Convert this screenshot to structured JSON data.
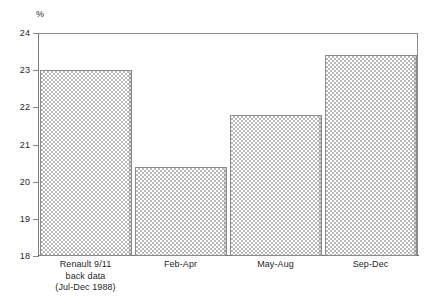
{
  "chart_data": {
    "type": "bar",
    "title": "",
    "subtitle": "",
    "xlabel": "",
    "ylabel": "%",
    "ylim": [
      18,
      24
    ],
    "ytick_labels": [
      "24",
      "23",
      "22",
      "21",
      "20",
      "19",
      "18"
    ],
    "yticks": [
      24,
      23,
      22,
      21,
      20,
      19,
      18
    ],
    "grid": false,
    "legend": "none",
    "categories": [
      "Renault 9/11\nback data\n(Jul-Dec 1988)",
      "Feb-Apr",
      "May-Aug",
      "Sep-Dec"
    ],
    "values": [
      23.0,
      20.4,
      21.8,
      23.4
    ],
    "bar_fill": "checkerboard-hatch",
    "bar_fill_color": "#b9b9b9",
    "bar_edge_color": "#8a8a8a",
    "axis_color": "#8a8a8a",
    "background_color": "#ffffff"
  },
  "axis": {
    "unit_label": "%",
    "ticks": [
      {
        "label": "24",
        "value": 24
      },
      {
        "label": "23",
        "value": 23
      },
      {
        "label": "22",
        "value": 22
      },
      {
        "label": "21",
        "value": 21
      },
      {
        "label": "20",
        "value": 20
      },
      {
        "label": "19",
        "value": 19
      },
      {
        "label": "18",
        "value": 18
      }
    ]
  },
  "bars": [
    {
      "label_line1": "Renault 9/11",
      "label_line2": "back data",
      "label_line3": "(Jul-Dec 1988)",
      "label": "Renault 9/11\nback data\n(Jul-Dec 1988)",
      "value": 23.0
    },
    {
      "label": "Feb-Apr",
      "value": 20.4
    },
    {
      "label": "May-Aug",
      "value": 21.8
    },
    {
      "label": "Sep-Dec",
      "value": 23.4
    }
  ]
}
